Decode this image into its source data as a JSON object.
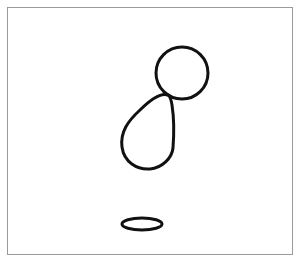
{
  "canvas": {
    "width": 296,
    "height": 263,
    "background": "#ffffff",
    "frame_color": "#9a9a9a",
    "stroke_color": "#111111",
    "stroke_width": 3
  },
  "shapes": [
    {
      "type": "circle",
      "name": "head-circle",
      "cx": 182,
      "cy": 73,
      "r": 26
    },
    {
      "type": "teardrop",
      "name": "body-teardrop",
      "tip": [
        168,
        94
      ],
      "bottom": [
        148,
        169
      ],
      "left": [
        122,
        140
      ],
      "right": [
        174,
        150
      ]
    },
    {
      "type": "ellipse",
      "name": "ground-ellipse",
      "cx": 142,
      "cy": 224,
      "rx": 20,
      "ry": 6
    }
  ]
}
